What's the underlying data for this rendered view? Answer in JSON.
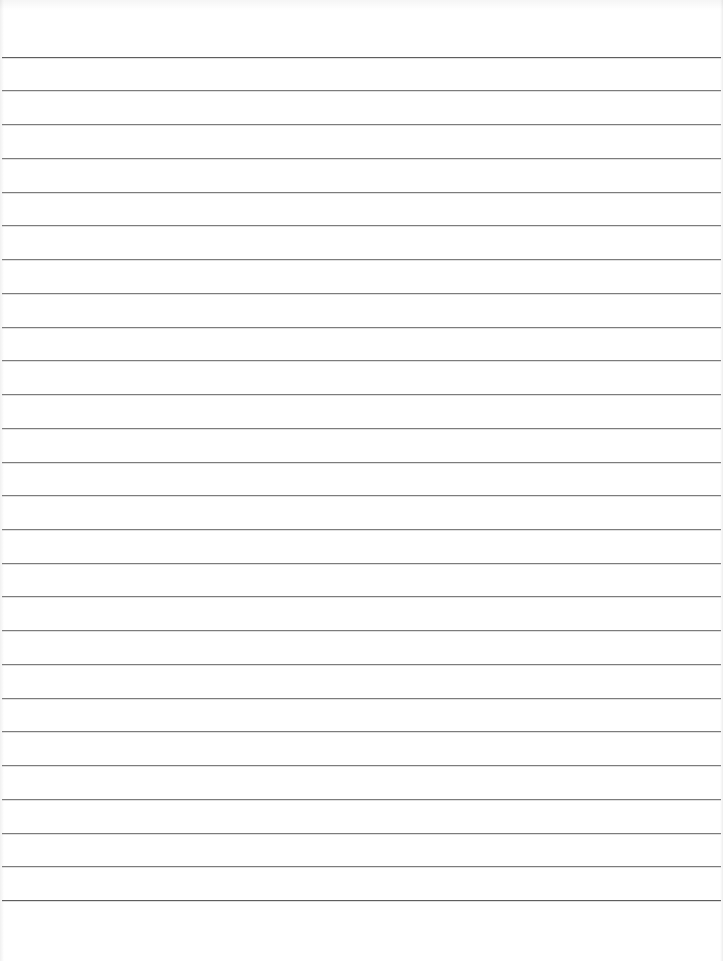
{
  "document": {
    "type": "lined-paper",
    "width": 723,
    "height": 961,
    "background_color": "#ffffff",
    "text_content": []
  },
  "rules": {
    "count": 26,
    "first_y": 56.7,
    "spacing": 33.73,
    "color": "#7c7c7c",
    "emphasized_color": "#5e5e5e",
    "emphasized_indices": [
      0,
      25
    ],
    "left": 2,
    "width": 719
  }
}
